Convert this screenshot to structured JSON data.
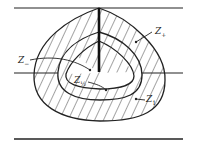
{
  "diagram": {
    "type": "level-set cross-section",
    "labels": {
      "z_plus": {
        "base": "Z",
        "sub": "+"
      },
      "z_minus": {
        "base": "Z",
        "sub": "−"
      },
      "z_half": {
        "base": "Z",
        "sub": "½"
      },
      "z_one": {
        "base": "Z",
        "sub": "1"
      }
    },
    "colors": {
      "stroke": "#222222",
      "hatch": "#333333",
      "background": "#ffffff"
    }
  }
}
